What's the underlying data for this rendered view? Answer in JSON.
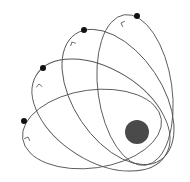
{
  "diagram": {
    "type": "orbital-precession",
    "width": 190,
    "height": 182,
    "colors": {
      "background": "#ffffff",
      "orbit_stroke": "#555555",
      "central_body": "#4a4a4a",
      "planet": "#111111",
      "arrow": "#666666"
    },
    "central_body": {
      "cx": 137,
      "cy": 132,
      "r": 12
    },
    "orbits": [
      {
        "id": "orbit-1",
        "cx": 135,
        "cy": 90,
        "rx": 37,
        "ry": 76,
        "rotate": -8,
        "planet": {
          "cx": 137,
          "cy": 16
        },
        "arrow": {
          "x": 121,
          "y": 23,
          "angle": 200
        }
      },
      {
        "id": "orbit-2",
        "cx": 118,
        "cy": 97,
        "rx": 44,
        "ry": 76,
        "rotate": -34,
        "planet": {
          "cx": 84,
          "cy": 30
        },
        "arrow": {
          "x": 72,
          "y": 42,
          "angle": 245
        }
      },
      {
        "id": "orbit-3",
        "cx": 101,
        "cy": 115,
        "rx": 46,
        "ry": 76,
        "rotate": -58,
        "planet": {
          "cx": 43,
          "cy": 68
        },
        "arrow": {
          "x": 39,
          "y": 84,
          "angle": 265
        }
      },
      {
        "id": "orbit-4",
        "cx": 92,
        "cy": 129,
        "rx": 70,
        "ry": 39,
        "rotate": -8,
        "planet": {
          "cx": 24,
          "cy": 121
        },
        "arrow": {
          "x": 28,
          "y": 137,
          "angle": 290
        }
      }
    ]
  }
}
